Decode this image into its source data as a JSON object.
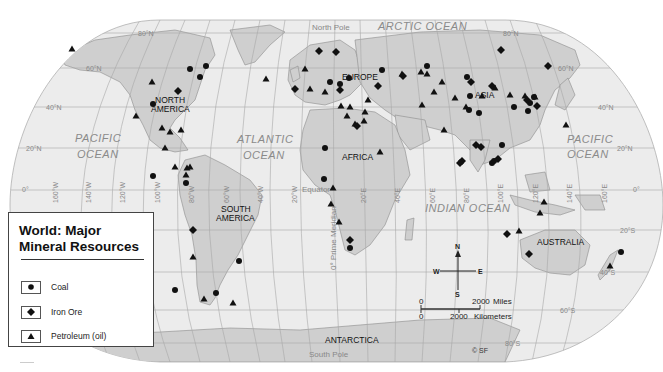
{
  "map": {
    "title_line1": "World: Major",
    "title_line2": "Mineral Resources",
    "copyright": "© SF",
    "colors": {
      "ocean": "#ececec",
      "land": "#cfcfcf",
      "grid": "#a8a8a8",
      "symbol": "#111111",
      "ocean_label": "#8a8a8a"
    }
  },
  "legend": {
    "items": [
      {
        "symbol": "circle",
        "label": "Coal"
      },
      {
        "symbol": "diamond",
        "label": "Iron Ore"
      },
      {
        "symbol": "triangle",
        "label": "Petroleum (oil)"
      }
    ]
  },
  "labels": {
    "continents": {
      "north_america_1": "NORTH",
      "north_america_2": "AMERICA",
      "south_america_1": "SOUTH",
      "south_america_2": "AMERICA",
      "europe": "EUROPE",
      "asia": "ASIA",
      "africa": "AFRICA",
      "australia": "AUSTRALIA",
      "antarctica": "ANTARCTICA"
    },
    "oceans": {
      "arctic": "ARCTIC OCEAN",
      "pacific_west_1": "PACIFIC",
      "pacific_west_2": "OCEAN",
      "atlantic_1": "ATLANTIC",
      "atlantic_2": "OCEAN",
      "indian": "INDIAN OCEAN",
      "pacific_east_1": "PACIFIC",
      "pacific_east_2": "OCEAN"
    },
    "special": {
      "north_pole": "North Pole",
      "south_pole": "South Pole",
      "equator": "Equator",
      "prime_meridian": "0° Prime Meridian"
    },
    "latitudes_left": [
      "80°N",
      "60°N",
      "40°N",
      "20°N",
      "0°"
    ],
    "latitudes_right": [
      "80°N",
      "60°N",
      "40°N",
      "20°N",
      "0°",
      "20°S",
      "40°S",
      "60°S",
      "80°S"
    ],
    "longitudes": [
      "160°W",
      "140°W",
      "120°W",
      "100°W",
      "80°W",
      "60°W",
      "40°W",
      "20°W",
      "20°E",
      "40°E",
      "60°E",
      "80°E",
      "100°E",
      "120°E",
      "140°E",
      "160°E"
    ]
  },
  "compass": {
    "n": "N",
    "s": "S",
    "e": "E",
    "w": "W"
  },
  "scale": {
    "miles_zero": "0",
    "miles_value": "2000",
    "miles_unit": "Miles",
    "km_zero": "0",
    "km_value": "2000",
    "km_unit": "Kilometers"
  },
  "resources": {
    "coal": [
      [
        190,
        69
      ],
      [
        200,
        77
      ],
      [
        206,
        66
      ],
      [
        153,
        176
      ],
      [
        153,
        104
      ],
      [
        239,
        261
      ],
      [
        216,
        293
      ],
      [
        324,
        179
      ],
      [
        325,
        148
      ],
      [
        330,
        82
      ],
      [
        340,
        84
      ],
      [
        349,
        78
      ],
      [
        350,
        248
      ],
      [
        382,
        70
      ],
      [
        427,
        66
      ],
      [
        467,
        77
      ],
      [
        470,
        96
      ],
      [
        469,
        110
      ],
      [
        479,
        113
      ],
      [
        492,
        163
      ],
      [
        494,
        161
      ],
      [
        502,
        145
      ],
      [
        514,
        107
      ],
      [
        528,
        111
      ],
      [
        534,
        97
      ],
      [
        530,
        103
      ],
      [
        621,
        252
      ],
      [
        175,
        290
      ],
      [
        186,
        183
      ]
    ],
    "iron": [
      [
        178,
        91
      ],
      [
        193,
        230
      ],
      [
        319,
        51
      ],
      [
        336,
        52
      ],
      [
        357,
        126
      ],
      [
        340,
        90
      ],
      [
        295,
        89
      ],
      [
        378,
        86
      ],
      [
        403,
        76
      ],
      [
        471,
        82
      ],
      [
        492,
        86
      ],
      [
        501,
        50
      ],
      [
        548,
        66
      ],
      [
        527,
        100
      ],
      [
        537,
        106
      ],
      [
        498,
        159
      ],
      [
        462,
        161
      ],
      [
        481,
        147
      ],
      [
        460,
        163
      ],
      [
        476,
        145
      ],
      [
        350,
        240
      ],
      [
        507,
        234
      ],
      [
        529,
        254
      ]
    ],
    "oil": [
      [
        72,
        49
      ],
      [
        152,
        82
      ],
      [
        136,
        116
      ],
      [
        162,
        128
      ],
      [
        170,
        132
      ],
      [
        181,
        130
      ],
      [
        165,
        148
      ],
      [
        175,
        167
      ],
      [
        190,
        167
      ],
      [
        186,
        175
      ],
      [
        193,
        257
      ],
      [
        204,
        299
      ],
      [
        233,
        303
      ],
      [
        187,
        168
      ],
      [
        266,
        79
      ],
      [
        305,
        69
      ],
      [
        310,
        89
      ],
      [
        325,
        92
      ],
      [
        341,
        106
      ],
      [
        347,
        116
      ],
      [
        355,
        124
      ],
      [
        364,
        121
      ],
      [
        380,
        152
      ],
      [
        402,
        74
      ],
      [
        421,
        72
      ],
      [
        427,
        74
      ],
      [
        434,
        92
      ],
      [
        442,
        82
      ],
      [
        455,
        98
      ],
      [
        482,
        96
      ],
      [
        495,
        88
      ],
      [
        510,
        95
      ],
      [
        525,
        96
      ],
      [
        535,
        97
      ],
      [
        566,
        125
      ],
      [
        466,
        107
      ],
      [
        331,
        204
      ],
      [
        339,
        222
      ],
      [
        544,
        202
      ],
      [
        540,
        213
      ],
      [
        519,
        231
      ],
      [
        610,
        266
      ],
      [
        422,
        105
      ],
      [
        444,
        130
      ],
      [
        365,
        112
      ],
      [
        333,
        188
      ],
      [
        350,
        107
      ],
      [
        368,
        100
      ]
    ]
  }
}
